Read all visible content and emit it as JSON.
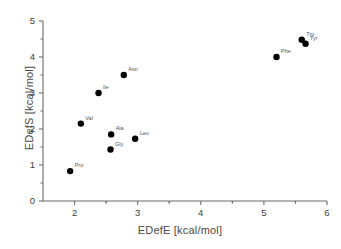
{
  "chart_data": {
    "type": "scatter",
    "title": "",
    "xlabel": "EDefE [kcal/mol]",
    "ylabel": "EDefS [kcal/mol]",
    "xlim": [
      1.5,
      6.0
    ],
    "ylim": [
      0,
      5
    ],
    "xticks": [
      "2",
      "3",
      "4",
      "5",
      "6"
    ],
    "xtick_values": [
      2,
      3,
      4,
      5,
      6
    ],
    "yticks": [
      "0",
      "1",
      "2",
      "3",
      "4",
      "5"
    ],
    "ytick_values": [
      0,
      1,
      2,
      3,
      4,
      5
    ],
    "minor_ticks": true,
    "grid": false,
    "legend": "none",
    "marker_color": "#000000",
    "axis_color": "#6b6b6b",
    "points": [
      {
        "label": "Pro",
        "x": 1.93,
        "y": 0.83
      },
      {
        "label": "Val",
        "x": 2.1,
        "y": 2.15
      },
      {
        "label": "Ile",
        "x": 2.38,
        "y": 3.0
      },
      {
        "label": "Gly",
        "x": 2.57,
        "y": 1.43
      },
      {
        "label": "Ala",
        "x": 2.58,
        "y": 1.85
      },
      {
        "label": "Asn",
        "x": 2.78,
        "y": 3.5
      },
      {
        "label": "Leu",
        "x": 2.96,
        "y": 1.73
      },
      {
        "label": "Phe",
        "x": 5.2,
        "y": 4.0
      },
      {
        "label": "Trp",
        "x": 5.6,
        "y": 4.48
      },
      {
        "label": "Tyr",
        "x": 5.66,
        "y": 4.37
      }
    ]
  }
}
